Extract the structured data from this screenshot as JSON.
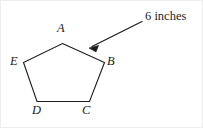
{
  "figure": {
    "kind": "geometry-diagram",
    "shape_name": "pentagon",
    "background_color": "#ffffff",
    "stroke_color": "#1b1b1b",
    "stroke_width": 1.1,
    "width": 203,
    "height": 128,
    "vertex_labels": [
      {
        "id": "A",
        "text": "A"
      },
      {
        "id": "B",
        "text": "B"
      },
      {
        "id": "C",
        "text": "C"
      },
      {
        "id": "D",
        "text": "D"
      },
      {
        "id": "E",
        "text": "E"
      }
    ],
    "annotation": {
      "text": "6 inches",
      "color": "#262626"
    },
    "pentagon_path": "M 61.5,42.5 L 103.5,61.5 L 88.5,100.5 L 36.0,100.5 L 22.5,61.5 Z",
    "arrow": {
      "line": {
        "x1": 141,
        "y1": 20.5,
        "x2": 91,
        "y2": 45.5
      },
      "head": "M 88.0,47.0 L 97.6,44.4 L 95.0,51.0 Z",
      "color": "#1b1b1b",
      "width": 1.2
    }
  }
}
